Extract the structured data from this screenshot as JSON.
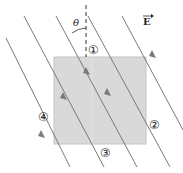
{
  "diagram": {
    "field_label": "E",
    "angle_label": "θ",
    "surfaces": [
      {
        "id": 1,
        "label": "①",
        "side": "top"
      },
      {
        "id": 2,
        "label": "②",
        "side": "right"
      },
      {
        "id": 3,
        "label": "③",
        "side": "bottom"
      },
      {
        "id": 4,
        "label": "④",
        "side": "left"
      }
    ],
    "colors": {
      "square_fill": "#d9d9d9",
      "square_edge": "#bdbdbd",
      "field_line": "#7a7a7a",
      "dashed_line": "#333333"
    }
  }
}
